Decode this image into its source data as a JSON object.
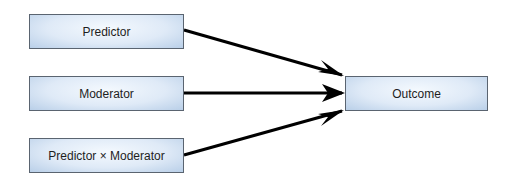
{
  "diagram": {
    "nodes": [
      {
        "id": "predictor",
        "label": "Predictor"
      },
      {
        "id": "moderator",
        "label": "Moderator"
      },
      {
        "id": "interaction",
        "label": "Predictor × Moderator"
      },
      {
        "id": "outcome",
        "label": "Outcome"
      }
    ],
    "edges": [
      {
        "from": "predictor",
        "to": "outcome"
      },
      {
        "from": "moderator",
        "to": "outcome"
      },
      {
        "from": "interaction",
        "to": "outcome"
      }
    ],
    "colors": {
      "box_fill": "#dfeaf7",
      "box_border": "#5a6470",
      "arrow": "#000000"
    }
  }
}
